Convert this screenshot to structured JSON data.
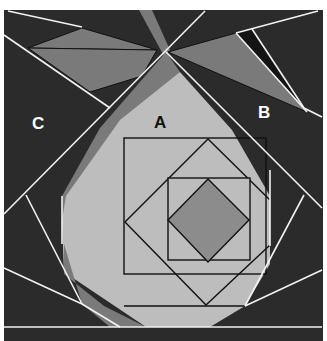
{
  "diagram": {
    "labels": {
      "a": "A",
      "b": "B",
      "c": "C"
    },
    "colors": {
      "background": "#2b2b2b",
      "mid_gray": "#7a7a7a",
      "light_gray": "#bdbdbd",
      "diamond": "#8c8c8c",
      "sliver": "#141414",
      "seam": "#f2f2f2",
      "outline": "#111111",
      "label_light": "#ffffff",
      "label_dark": "#111111"
    }
  }
}
